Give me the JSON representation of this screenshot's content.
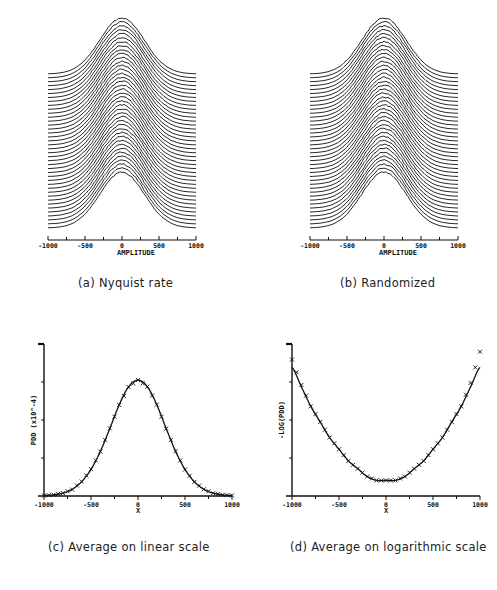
{
  "figure": {
    "panels": [
      {
        "id": "a",
        "caption": "(a) Nyquist rate",
        "xlabel": "AMPLITUDE",
        "xticks": [
          "-1000",
          "-500",
          "0",
          "500",
          "1000"
        ]
      },
      {
        "id": "b",
        "caption": "(b) Randomized",
        "xlabel": "AMPLITUDE",
        "xticks": [
          "-1000",
          "-500",
          "0",
          "500",
          "1000"
        ]
      },
      {
        "id": "c",
        "caption": "(c) Average on linear scale",
        "xlabel": "X",
        "ylabel": "PDD (x10^-4)",
        "xticks": [
          "-1000",
          "-500",
          "0",
          "500",
          "1000"
        ]
      },
      {
        "id": "d",
        "caption": "(d) Average on logarithmic scale",
        "xlabel": "X",
        "ylabel": "-LOG(PDD)",
        "xticks": [
          "-1000",
          "-500",
          "0",
          "500",
          "1000"
        ]
      }
    ],
    "line_color": "#111111",
    "background": "#ffffff"
  },
  "chart_data": [
    {
      "type": "line",
      "title": "(a) Nyquist rate",
      "xlabel": "AMPLITUDE",
      "ylabel": "",
      "xlim": [
        -1000,
        1000
      ],
      "description": "Waterfall of ~40 stacked Gaussian-like probability density traces, each offset vertically",
      "num_traces": 40,
      "trace_shape": "gaussian",
      "trace_center": 0,
      "trace_sigma": 300
    },
    {
      "type": "line",
      "title": "(b) Randomized",
      "xlabel": "AMPLITUDE",
      "ylabel": "",
      "xlim": [
        -1000,
        1000
      ],
      "description": "Waterfall of ~40 stacked Gaussian-like probability density traces, each offset vertically",
      "num_traces": 40,
      "trace_shape": "gaussian",
      "trace_center": 0,
      "trace_sigma": 300
    },
    {
      "type": "line",
      "title": "(c) Average on linear scale",
      "xlabel": "X",
      "ylabel": "PDD (x10^-4)",
      "xlim": [
        -1000,
        1000
      ],
      "ylim": [
        0,
        1.6
      ],
      "x": [
        -1000,
        -900,
        -800,
        -700,
        -600,
        -500,
        -400,
        -300,
        -200,
        -100,
        0,
        100,
        200,
        300,
        400,
        500,
        600,
        700,
        800,
        900,
        1000
      ],
      "series": [
        {
          "name": "theoretical",
          "style": "line",
          "values": [
            0.005,
            0.012,
            0.03,
            0.07,
            0.15,
            0.28,
            0.47,
            0.71,
            0.96,
            1.15,
            1.22,
            1.15,
            0.96,
            0.71,
            0.47,
            0.28,
            0.15,
            0.07,
            0.03,
            0.012,
            0.005
          ]
        },
        {
          "name": "measured",
          "style": "x-markers",
          "values": [
            0.005,
            0.013,
            0.031,
            0.068,
            0.152,
            0.282,
            0.468,
            0.712,
            0.958,
            1.148,
            1.221,
            1.151,
            0.962,
            0.708,
            0.472,
            0.278,
            0.148,
            0.071,
            0.029,
            0.012,
            0.006
          ]
        }
      ],
      "grid": false
    },
    {
      "type": "line",
      "title": "(d) Average on logarithmic scale",
      "xlabel": "X",
      "ylabel": "-LOG(PDD)",
      "xlim": [
        -1000,
        1000
      ],
      "x": [
        -1000,
        -900,
        -800,
        -700,
        -600,
        -500,
        -400,
        -300,
        -200,
        -100,
        0,
        100,
        200,
        300,
        400,
        500,
        600,
        700,
        800,
        900,
        1000
      ],
      "series": [
        {
          "name": "theoretical",
          "style": "line",
          "values": [
            8.6,
            8.1,
            7.6,
            7.2,
            6.8,
            6.5,
            6.2,
            6.0,
            5.8,
            5.7,
            5.7,
            5.7,
            5.8,
            6.0,
            6.2,
            6.5,
            6.8,
            7.2,
            7.6,
            8.1,
            8.6
          ]
        },
        {
          "name": "measured",
          "style": "x-markers",
          "values": [
            8.8,
            8.15,
            7.6,
            7.2,
            6.8,
            6.5,
            6.2,
            6.0,
            5.8,
            5.7,
            5.7,
            5.7,
            5.8,
            6.0,
            6.2,
            6.5,
            6.8,
            7.2,
            7.6,
            8.2,
            9.0
          ]
        }
      ],
      "grid": false
    }
  ]
}
